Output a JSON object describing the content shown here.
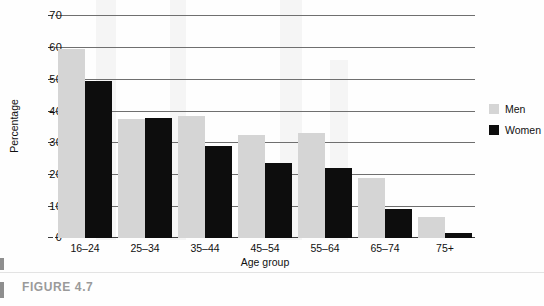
{
  "figure": {
    "caption": "FIGURE 4.7"
  },
  "chart_data": {
    "type": "bar",
    "title": "",
    "xlabel": "Age group",
    "ylabel": "Percentage",
    "categories": [
      "16–24",
      "25–34",
      "35–44",
      "45–54",
      "55–64",
      "65–74",
      "75+"
    ],
    "series": [
      {
        "name": "Men",
        "color": "#d5d5d5",
        "values": [
          59.5,
          37.5,
          38.5,
          32.5,
          33.0,
          19.0,
          6.5
        ]
      },
      {
        "name": "Women",
        "color": "#0d0d0d",
        "values": [
          49.5,
          38.0,
          29.0,
          23.5,
          22.0,
          9.0,
          1.5
        ]
      }
    ],
    "ylim": [
      0,
      70
    ],
    "yticks": [
      0,
      10,
      20,
      30,
      40,
      50,
      60,
      70
    ],
    "ytick_labels": [
      "0",
      "10",
      "20",
      "30",
      "40",
      "50",
      "60",
      "70"
    ],
    "grid": true,
    "legend_position": "right"
  }
}
